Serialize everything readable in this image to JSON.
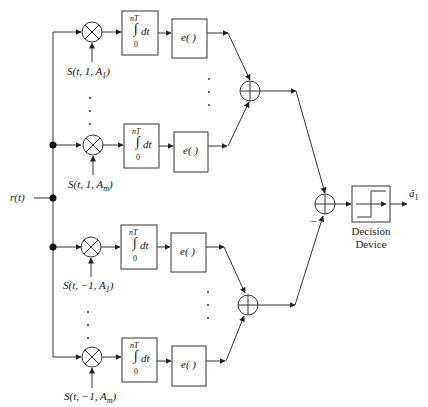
{
  "input_label": "r(t)",
  "output_label": "â",
  "output_sub": "1",
  "decision_device": {
    "line1": "Decision",
    "line2": "Device"
  },
  "minus_sign": "–",
  "branches": [
    {
      "signal": "S(t, 1, A",
      "sub": "1",
      "y": 32
    },
    {
      "signal": "S(t, 1, A",
      "sub": "m",
      "y": 145
    },
    {
      "signal": "S(t, −1, A",
      "sub": "1",
      "y": 247
    },
    {
      "signal": "S(t, −1, A",
      "sub": "m",
      "y": 357
    }
  ],
  "integrator": {
    "upper": "nT",
    "lower": "0",
    "body": "dt"
  },
  "exp_block": "e( )"
}
